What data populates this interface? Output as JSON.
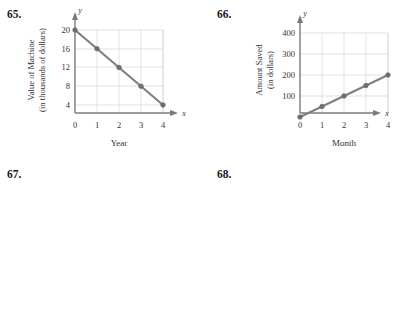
{
  "page": {
    "background_color": "#ffffff",
    "text_color": "#231f20",
    "series_color": "#808080",
    "grid_color": "#d9d9d9",
    "axis_color": "#7a7a7a"
  },
  "problems": [
    {
      "number": "65.",
      "chart_data": {
        "type": "line",
        "title": "",
        "xlabel": "Year",
        "ylabel": "Value of Machine",
        "ylabel_line2": "(in thousands of dollars)",
        "x_axis_letter": "x",
        "y_axis_letter": "y",
        "x": [
          0,
          1,
          2,
          3,
          4
        ],
        "values": [
          20,
          16,
          12,
          8,
          4
        ],
        "xticks": [
          "0",
          "1",
          "2",
          "3",
          "4"
        ],
        "yticks": [
          "4",
          "8",
          "12",
          "16",
          "20"
        ],
        "xlim": [
          0,
          4
        ],
        "ylim": [
          0,
          22
        ],
        "grid": true,
        "legend": "none"
      }
    },
    {
      "number": "66.",
      "chart_data": {
        "type": "line",
        "title": "",
        "xlabel": "Month",
        "ylabel": "Amount Saved",
        "ylabel_line2": "(in dollars)",
        "x_axis_letter": "x",
        "y_axis_letter": "y",
        "x": [
          0,
          1,
          2,
          3,
          4
        ],
        "values": [
          0,
          50,
          100,
          150,
          200
        ],
        "xticks": [
          "0",
          "1",
          "2",
          "3",
          "4"
        ],
        "yticks": [
          "100",
          "200",
          "300",
          "400"
        ],
        "xlim": [
          0,
          4
        ],
        "ylim": [
          0,
          440
        ],
        "grid": true,
        "legend": "none"
      }
    },
    {
      "number": "67.",
      "chart_data": {
        "type": "line",
        "title": "",
        "xlabel": "Year",
        "ylabel": "Percent of Pay Raise",
        "ylabel_line2": "",
        "x_axis_letter": "x",
        "y_axis_letter": "y",
        "x": [
          0,
          1,
          2,
          3,
          4
        ],
        "values": [
          3,
          3,
          3,
          3,
          3
        ],
        "xticks": [
          "0",
          "1",
          "2",
          "3",
          "4"
        ],
        "yticks": [
          "2",
          "4",
          "6",
          "8"
        ],
        "xlim": [
          0,
          4
        ],
        "ylim": [
          0,
          8.8
        ],
        "grid": true,
        "legend": "none"
      }
    },
    {
      "number": "68.",
      "chart_data": {
        "type": "line",
        "title": "",
        "xlabel": "Year",
        "ylabel": "Number of Named",
        "ylabel_line2": "Hurricanes",
        "x_axis_letter": "x",
        "y_axis_letter": "y",
        "x": [
          0,
          1,
          2,
          3
        ],
        "values": [
          10,
          10,
          10,
          10
        ],
        "xticks": [
          "0",
          "1",
          "2",
          "3"
        ],
        "yticks": [
          "5",
          "10",
          "15",
          "20"
        ],
        "xlim": [
          0,
          3
        ],
        "ylim": [
          0,
          22
        ],
        "grid": true,
        "legend": "none"
      }
    }
  ]
}
